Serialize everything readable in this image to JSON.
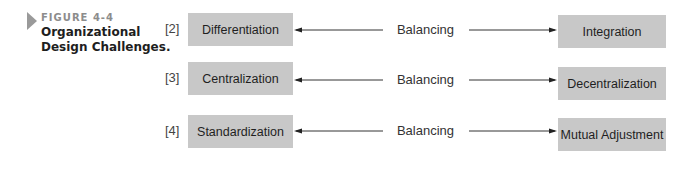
{
  "figure": {
    "number": "FIGURE 4-4",
    "title": "Organizational Design Challenges."
  },
  "rows": [
    {
      "num": "[2]",
      "left": "Differentiation",
      "connector": "Balancing",
      "right": "Integration"
    },
    {
      "num": "[3]",
      "left": "Centralization",
      "connector": "Balancing",
      "right": "Decentralization"
    },
    {
      "num": "[4]",
      "left": "Standardization",
      "connector": "Balancing",
      "right": "Mutual Adjustment"
    }
  ]
}
